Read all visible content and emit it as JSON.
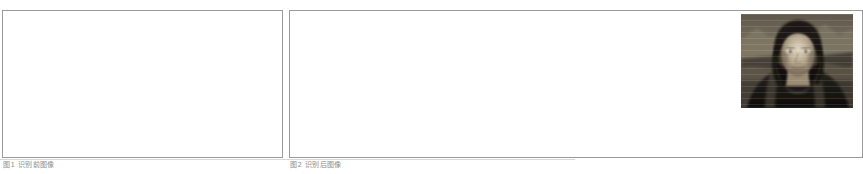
{
  "document": {
    "background_color": "#ffffff",
    "border_color": "#9a9a9a",
    "caption_color": "#8d8d8d"
  },
  "figures": [
    {
      "id": "figure-left",
      "caption": "图1 识别前图像",
      "panel": {
        "cells": [
          {
            "id": "cell-a",
            "content": "empty"
          },
          {
            "id": "cell-b",
            "content": "empty"
          }
        ]
      }
    },
    {
      "id": "figure-right",
      "caption": "图2 识别后图像",
      "panel": {
        "cells": [
          {
            "id": "cell-a",
            "content": "empty"
          },
          {
            "id": "cell-b",
            "content": "image"
          }
        ]
      },
      "image": {
        "name": "mona-lisa-grayscale",
        "alt": "Mona Lisa grayscale portrait",
        "colors": {
          "darkest": "#101010",
          "dark": "#2b2620",
          "mid": "#6b6054",
          "light": "#b7a893",
          "lightest": "#e6dcc9"
        }
      }
    }
  ]
}
